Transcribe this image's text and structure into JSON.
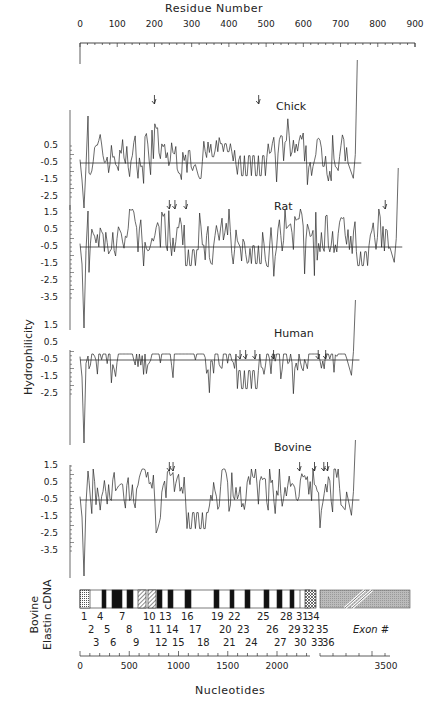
{
  "chart_data": {
    "type": "line",
    "title": "",
    "top_axis": {
      "label": "Residue Number",
      "ticks": [
        0,
        100,
        200,
        300,
        400,
        500,
        600,
        700,
        800,
        900
      ],
      "range": [
        0,
        900
      ]
    },
    "ylabel": "Hydrophilicity",
    "yticks": [
      "0.5",
      "-0.5",
      "-1.5",
      "-2.5",
      "1.5",
      "0.5",
      "-0.5",
      "-1.5",
      "-2.5",
      "-3.5"
    ],
    "series": [
      {
        "name": "Chick",
        "yticks": [
          0.5,
          -0.5,
          -1.5,
          -2.5
        ],
        "approx_residue_count": 750,
        "arrows_at_residue": [
          200,
          480
        ],
        "baseline": 0,
        "note": "hydrophilicity profile, mostly between -1.5 and 1.0"
      },
      {
        "name": "Rat",
        "yticks": [
          1.5,
          0.5,
          -0.5,
          -1.5,
          -2.5,
          -3.5
        ],
        "approx_residue_count": 860,
        "arrows_at_residue": [
          240,
          255,
          285,
          820
        ],
        "baseline": 0,
        "note": "hydrophilicity profile, mostly between -1.8 and 1.2"
      },
      {
        "name": "Human",
        "yticks": [
          1.5,
          0.5,
          -0.5,
          -1.5,
          -2.5
        ],
        "approx_residue_count": 740,
        "arrows_at_residue": [
          430,
          445,
          470,
          520,
          640,
          660
        ],
        "baseline": 0,
        "note": "hydrophilicity profile, mostly between -2.0 and 1.5"
      },
      {
        "name": "Bovine",
        "yticks": [
          1.5,
          0.5,
          -0.5,
          -1.5,
          -2.5,
          -3.5
        ],
        "approx_residue_count": 740,
        "arrows_at_residue": [
          240,
          250,
          590,
          630,
          655,
          665
        ],
        "baseline": 0,
        "note": "hydrophilicity profile, mostly between -2.0 and 1.5"
      }
    ],
    "bottom_axis": {
      "label": "Nucleotides",
      "ticks": [
        0,
        500,
        1000,
        1500,
        2000,
        3500
      ]
    },
    "cdna_map": {
      "label_line1": "Bovine",
      "label_line2": "Elastin cDNA",
      "exon_label": "Exon #",
      "exon_row1": [
        "1",
        "4",
        "7",
        "10",
        "13",
        "16",
        "19",
        "22",
        "25",
        "28",
        "31",
        "34"
      ],
      "exon_row2": [
        "2",
        "5",
        "8",
        "11",
        "14",
        "17",
        "20",
        "23",
        "26",
        "29",
        "32",
        "35"
      ],
      "exon_row3": [
        "3",
        "6",
        "9",
        "12",
        "15",
        "18",
        "21",
        "24",
        "27",
        "30",
        "33",
        "36"
      ]
    }
  },
  "labels": {
    "top_axis_title": "Residue Number",
    "y_axis_title": "Hydrophilicity",
    "bottom_axis_title": "Nucleotides",
    "species": [
      "Chick",
      "Rat",
      "Human",
      "Bovine"
    ],
    "cdna_line1": "Bovine",
    "cdna_line2": "Elastin cDNA",
    "exon_hash": "Exon #",
    "top_ticks": [
      "0",
      "100",
      "200",
      "300",
      "400",
      "500",
      "600",
      "700",
      "800",
      "900"
    ],
    "bottom_ticks": [
      "0",
      "500",
      "1000",
      "1500",
      "2000",
      "3500"
    ],
    "chick_yticks": [
      "0.5",
      "-0.5",
      "-1.5",
      "-2.5"
    ],
    "rat_yticks": [
      "1.5",
      "0.5",
      "-0.5",
      "-1.5",
      "-2.5",
      "-3.5"
    ],
    "human_yticks": [
      "1.5",
      "0.5",
      "-0.5",
      "-1.5",
      "-2.5"
    ],
    "bovine_yticks": [
      "1.5",
      "0.5",
      "-0.5",
      "-1.5",
      "-2.5",
      "-3.5"
    ],
    "exon_row1": [
      "1",
      "4",
      "7",
      "10",
      "13",
      "16",
      "19",
      "22",
      "25",
      "28",
      "31",
      "34"
    ],
    "exon_row2": [
      "2",
      "5",
      "8",
      "11",
      "14",
      "17",
      "20",
      "23",
      "26",
      "29",
      "32",
      "35"
    ],
    "exon_row3": [
      "3",
      "6",
      "9",
      "12",
      "15",
      "18",
      "21",
      "24",
      "27",
      "30",
      "33",
      "36"
    ]
  }
}
